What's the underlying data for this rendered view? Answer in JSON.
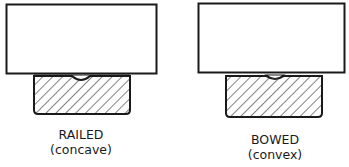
{
  "diagram": {
    "colors": {
      "stroke": "#1a1a1a",
      "background": "#ffffff"
    },
    "figures": [
      {
        "name": "railed",
        "title": "RAILED",
        "subtitle": "(concave)",
        "surface_shape": "concave dip"
      },
      {
        "name": "bowed",
        "title": "BOWED",
        "subtitle": "(convex)",
        "surface_shape": "convex bump"
      }
    ]
  }
}
